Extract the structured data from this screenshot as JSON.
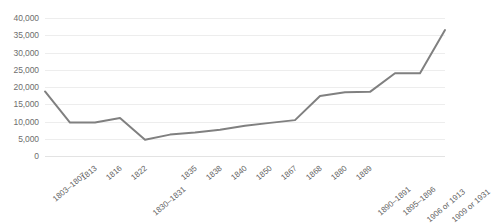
{
  "chart_data": {
    "type": "line",
    "title": "",
    "subtitle": "",
    "xlabel": "",
    "ylabel": "",
    "ylim": [
      0,
      40000
    ],
    "ytick_step": 5000,
    "grid": true,
    "legend": false,
    "legend_position": "none",
    "line_color": "#808080",
    "gridline_color": "#ededed",
    "tick_label_color": "#6e6e6e",
    "x_label_rotation_deg": -40,
    "categories": [
      "1803–1807",
      "1813",
      "1816",
      "1822",
      "1830–1831",
      "1835",
      "1838",
      "1840",
      "1850",
      "1867",
      "1868",
      "1880",
      "1889",
      "1890–1891",
      "1895–1896",
      "1906 or 1913",
      "1909 or 1931"
    ],
    "category_stagger": [
      0,
      0,
      0,
      0,
      1,
      0,
      0,
      0,
      0,
      0,
      0,
      0,
      0,
      1,
      1,
      1,
      1
    ],
    "values": [
      18700,
      9700,
      9700,
      11000,
      4700,
      6200,
      6800,
      7600,
      8800,
      9600,
      10400,
      17400,
      18500,
      18600,
      24000,
      24000,
      36500
    ],
    "ytick_labels": [
      "40,000",
      "35,000",
      "30,000",
      "25,000",
      "20,000",
      "15,000",
      "10,000",
      "5,000",
      "0"
    ],
    "ytick_values": [
      40000,
      35000,
      30000,
      25000,
      20000,
      15000,
      10000,
      5000,
      0
    ]
  }
}
